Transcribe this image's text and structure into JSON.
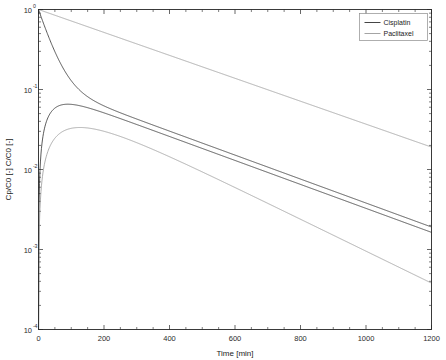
{
  "chart_data": {
    "type": "line",
    "title": "",
    "xlabel": "Time [min]",
    "ylabel": "Cp/C0 [-]   C/C0 [-]",
    "ylabel_parts": [
      "Cp/C0 [-]",
      "C/C0 [-]"
    ],
    "xlim": [
      0,
      1200
    ],
    "ylim": [
      0.0001,
      1
    ],
    "yscale": "log",
    "xscale": "linear",
    "grid": false,
    "box": true,
    "minor_ticks": true,
    "xticks": [
      0,
      200,
      400,
      600,
      800,
      1000,
      1200
    ],
    "xticklabels": [
      "0",
      "200",
      "400",
      "600",
      "800",
      "1000",
      "1200"
    ],
    "yticks": [
      1,
      0.1,
      0.01,
      0.001,
      0.0001
    ],
    "yticklabels": [
      "10^0",
      "10^-1",
      "10^-2",
      "10^-3",
      "10^-4"
    ],
    "ytick_mantissas": [
      "10",
      "10",
      "10",
      "10",
      "10"
    ],
    "ytick_exponents": [
      "0",
      "-1",
      "-2",
      "-3",
      "-4"
    ],
    "legend": {
      "position": "top-right",
      "entries": [
        {
          "label": "Cisplatin",
          "color": "#303030"
        },
        {
          "label": "Paclitaxel",
          "color": "#9a9a9a"
        }
      ]
    },
    "series": [
      {
        "name": "Cisplatin plasma",
        "legend_group": "Cisplatin",
        "color": "#303030",
        "kind": "plasma",
        "model": "biexponential",
        "params": {
          "A": 0.88,
          "alpha": 0.03,
          "B": 0.12,
          "beta": 0.00345
        },
        "x": [
          0,
          5,
          10,
          20,
          30,
          45,
          60,
          80,
          100,
          130,
          160,
          200,
          250,
          300,
          400,
          500,
          600,
          700,
          800,
          900,
          1000,
          1100,
          1200
        ],
        "y": [
          1.0,
          0.877,
          0.772,
          0.603,
          0.477,
          0.336,
          0.247,
          0.172,
          0.13,
          0.0975,
          0.082,
          0.0688,
          0.0565,
          0.0473,
          0.0328,
          0.0229,
          0.016,
          0.0112,
          0.00783,
          0.00547,
          0.00382,
          0.00267,
          0.00187
        ]
      },
      {
        "name": "Cisplatin tissue",
        "legend_group": "Cisplatin",
        "color": "#303030",
        "kind": "tissue",
        "model": "absorption-elimination",
        "params": {
          "ka": 0.026,
          "ke": 0.00345,
          "peak_t": 90,
          "peak_y": 0.0655
        },
        "x": [
          0,
          2,
          5,
          10,
          20,
          30,
          45,
          60,
          80,
          90,
          110,
          140,
          180,
          220,
          300,
          400,
          500,
          600,
          700,
          800,
          900,
          1000,
          1100,
          1200
        ],
        "y": [
          0.0,
          0.0034,
          0.0081,
          0.015,
          0.0266,
          0.036,
          0.047,
          0.0547,
          0.0622,
          0.0643,
          0.0655,
          0.0644,
          0.0607,
          0.0562,
          0.047,
          0.0348,
          0.0251,
          0.0179,
          0.0127,
          0.00894,
          0.00629,
          0.00442,
          0.0031,
          0.00218
        ]
      },
      {
        "name": "Paclitaxel plasma",
        "legend_group": "Paclitaxel",
        "color": "#9a9a9a",
        "kind": "plasma",
        "model": "monoexponential",
        "params": {
          "A": 1.0,
          "k": 0.0033
        },
        "x": [
          0,
          100,
          200,
          300,
          400,
          500,
          600,
          700,
          800,
          900,
          1000,
          1100,
          1200
        ],
        "y": [
          1.0,
          0.719,
          0.517,
          0.372,
          0.267,
          0.192,
          0.138,
          0.0993,
          0.0714,
          0.0513,
          0.0369,
          0.0265,
          0.0191
        ]
      },
      {
        "name": "Paclitaxel tissue",
        "legend_group": "Paclitaxel",
        "color": "#9a9a9a",
        "kind": "tissue",
        "model": "absorption-elimination",
        "params": {
          "ka": 0.0125,
          "ke": 0.0046,
          "peak_t": 300,
          "peak_y": 0.0335
        },
        "x": [
          0,
          2,
          5,
          10,
          20,
          40,
          60,
          90,
          120,
          160,
          200,
          250,
          300,
          350,
          400,
          500,
          600,
          700,
          800,
          900,
          1000,
          1100,
          1200
        ],
        "y": [
          0.0,
          0.00195,
          0.0047,
          0.0088,
          0.0159,
          0.0244,
          0.0288,
          0.032,
          0.0332,
          0.0336,
          0.0335,
          0.033,
          0.0322,
          0.0311,
          0.0299,
          0.0263,
          0.0223,
          0.0183,
          0.0148,
          0.0118,
          0.00938,
          0.00742,
          0.00585
        ]
      }
    ],
    "annotations": []
  },
  "figure": {
    "background_color": "#ffffff",
    "axes_color": "#262626",
    "text_color": "#1a1a1a",
    "legend_border_color": "#8c8c8c"
  }
}
